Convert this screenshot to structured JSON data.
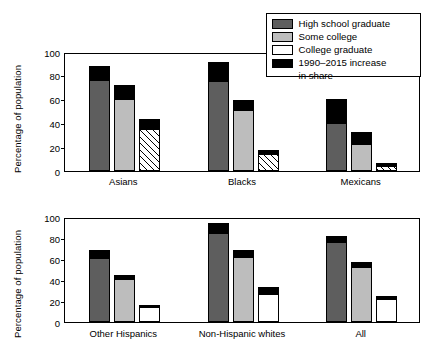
{
  "chart_data": {
    "type": "bar",
    "subtype": "stacked-bar-grouped",
    "title": "",
    "ylabel": "Percentage of population",
    "xlabel": "",
    "ylim": [
      0,
      100
    ],
    "yticks": [
      0,
      20,
      40,
      60,
      80,
      100
    ],
    "grid": false,
    "legend_position": "top-right",
    "stack_note": "Each bar = base share (1990) plus black cap = 1990–2015 increase in share; bar top = 2015 level.",
    "legend": [
      {
        "label": "High school graduate",
        "color": "#5e5e5e",
        "key": "hsg"
      },
      {
        "label": "Some college",
        "color": "#bdbdbd",
        "key": "sc"
      },
      {
        "label": "College graduate",
        "color": "#ffffff",
        "key": "cg"
      },
      {
        "label": "1990–2015 increase",
        "label2": "in share",
        "color": "#000000",
        "key": "inc"
      }
    ],
    "series": [
      {
        "name": "High school graduate",
        "key": "hsg",
        "color": "#5e5e5e"
      },
      {
        "name": "Some college",
        "key": "sc",
        "color": "#bdbdbd"
      },
      {
        "name": "College graduate",
        "key": "cg",
        "color": "#ffffff"
      },
      {
        "name": "1990–2015 increase in share",
        "key": "inc",
        "color": "#000000"
      }
    ],
    "panels": [
      {
        "id": "top",
        "hatched_college": true,
        "categories": [
          "Asians",
          "Blacks",
          "Mexicans"
        ],
        "groups": [
          {
            "category": "Asians",
            "bars": [
              {
                "key": "hsg",
                "base": 76,
                "increase": 12,
                "total": 88
              },
              {
                "key": "sc",
                "base": 60,
                "increase": 12,
                "total": 72
              },
              {
                "key": "cg",
                "base": 35,
                "increase": 8,
                "total": 43
              }
            ]
          },
          {
            "category": "Blacks",
            "bars": [
              {
                "key": "hsg",
                "base": 75,
                "increase": 16,
                "total": 91
              },
              {
                "key": "sc",
                "base": 51,
                "increase": 8,
                "total": 59
              },
              {
                "key": "cg",
                "base": 14,
                "increase": 3,
                "total": 17
              }
            ]
          },
          {
            "category": "Mexicans",
            "bars": [
              {
                "key": "hsg",
                "base": 40,
                "increase": 20,
                "total": 60
              },
              {
                "key": "sc",
                "base": 22,
                "increase": 10,
                "total": 32
              },
              {
                "key": "cg",
                "base": 4,
                "increase": 2,
                "total": 6
              }
            ]
          }
        ]
      },
      {
        "id": "bottom",
        "hatched_college": false,
        "categories": [
          "Other Hispanics",
          "Non-Hispanic whites",
          "All"
        ],
        "groups": [
          {
            "category": "Other Hispanics",
            "bars": [
              {
                "key": "hsg",
                "base": 61,
                "increase": 8,
                "total": 69
              },
              {
                "key": "sc",
                "base": 41,
                "increase": 4,
                "total": 45
              },
              {
                "key": "cg",
                "base": 14,
                "increase": 2,
                "total": 16
              }
            ]
          },
          {
            "category": "Non-Hispanic whites",
            "bars": [
              {
                "key": "hsg",
                "base": 85,
                "increase": 9,
                "total": 94
              },
              {
                "key": "sc",
                "base": 62,
                "increase": 7,
                "total": 69
              },
              {
                "key": "cg",
                "base": 27,
                "increase": 6,
                "total": 33
              }
            ]
          },
          {
            "category": "All",
            "bars": [
              {
                "key": "hsg",
                "base": 76,
                "increase": 6,
                "total": 82
              },
              {
                "key": "sc",
                "base": 52,
                "increase": 5,
                "total": 57
              },
              {
                "key": "cg",
                "base": 22,
                "increase": 3,
                "total": 25
              }
            ]
          }
        ]
      }
    ]
  }
}
